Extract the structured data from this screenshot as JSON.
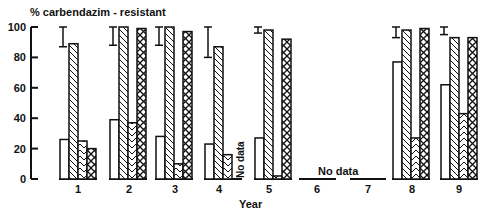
{
  "chart_data": {
    "type": "bar",
    "title": "",
    "ylabel": "% carbendazim - resistant",
    "xlabel": "Year",
    "ylim": [
      0,
      100
    ],
    "yticks": [
      0,
      20,
      40,
      60,
      80,
      100
    ],
    "grid": false,
    "legend": null,
    "categories": [
      "1",
      "2",
      "3",
      "4",
      "5",
      "6",
      "7",
      "8",
      "9"
    ],
    "series": [
      {
        "name": "open bar",
        "pattern": "none",
        "values": [
          26,
          39,
          28,
          23,
          27,
          null,
          null,
          77,
          62
        ]
      },
      {
        "name": "diagonal hatch",
        "pattern": "diagonal",
        "values": [
          89,
          100,
          100,
          87,
          98,
          null,
          null,
          98,
          93
        ]
      },
      {
        "name": "chevron hatch",
        "pattern": "chevron",
        "values": [
          25,
          37,
          10,
          16,
          2,
          null,
          null,
          27,
          43
        ]
      },
      {
        "name": "cross hatch",
        "pattern": "cross",
        "values": [
          20,
          99,
          97,
          null,
          92,
          null,
          null,
          99,
          93
        ]
      }
    ],
    "error_bars": [
      {
        "category": "1",
        "low": 87,
        "high": 100
      },
      {
        "category": "2",
        "low": 88,
        "high": 100
      },
      {
        "category": "3",
        "low": 88,
        "high": 100
      },
      {
        "category": "4",
        "low": 80,
        "high": 100
      },
      {
        "category": "5",
        "low": 96,
        "high": 100
      },
      {
        "category": "8",
        "low": 93,
        "high": 100
      },
      {
        "category": "9",
        "low": 95,
        "high": 100
      }
    ],
    "annotations": [
      {
        "text": "No data",
        "category": "4",
        "series": "cross hatch",
        "rotated": true
      },
      {
        "text": "No data",
        "category": "6-7"
      }
    ]
  },
  "labels": {
    "ylabel": "% carbendazim - resistant",
    "xlabel": "Year",
    "no_data": "No data",
    "ticks": [
      "0",
      "20",
      "40",
      "60",
      "80",
      "100"
    ],
    "years": [
      "1",
      "2",
      "3",
      "4",
      "5",
      "6",
      "7",
      "8",
      "9"
    ]
  }
}
